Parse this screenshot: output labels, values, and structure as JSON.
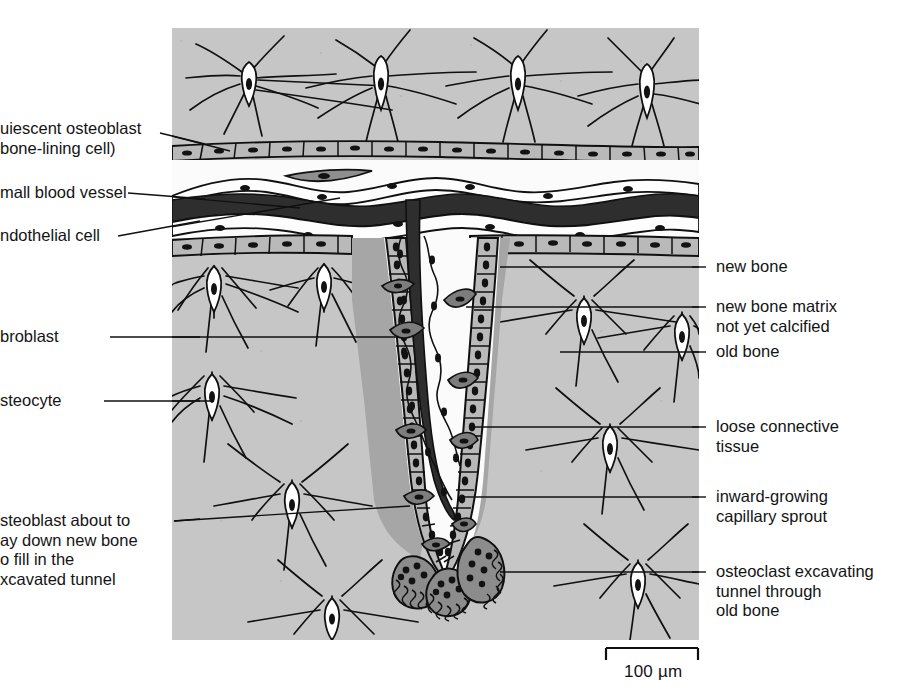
{
  "figure": {
    "title_present": false,
    "panel": {
      "x": 172,
      "y": 28,
      "width": 527,
      "height": 612
    },
    "colors": {
      "old_bone": "#c6c6c6",
      "new_bone_matrix_uncalcified": "#a6a6a6",
      "cell_fill": "#b9b9b9",
      "blood_vessel_lumen": "#2e2e2e",
      "osteoclast_fill": "#8c8c8c",
      "nucleus": "#121212",
      "lacuna": "#ffffff",
      "outline": "#101010",
      "background": "#ffffff"
    }
  },
  "labels_left": [
    {
      "name": "quiescent-osteoblast",
      "lines": [
        "uiescent osteoblast",
        "bone-lining cell)"
      ],
      "full_text": "quiescent osteoblast (bone-lining cell)",
      "clipped_at_left_edge": true,
      "x": 0,
      "y": 120
    },
    {
      "name": "small-blood-vessel",
      "lines": [
        "mall blood vessel"
      ],
      "full_text": "small blood vessel",
      "clipped_at_left_edge": true,
      "x": 0,
      "y": 185
    },
    {
      "name": "endothelial-cell",
      "lines": [
        "ndothelial cell"
      ],
      "full_text": "endothelial cell",
      "clipped_at_left_edge": true,
      "x": 0,
      "y": 228
    },
    {
      "name": "fibroblast",
      "lines": [
        "broblast"
      ],
      "full_text": "fibroblast",
      "clipped_at_left_edge": true,
      "x": 0,
      "y": 328
    },
    {
      "name": "osteocyte",
      "lines": [
        "steocyte"
      ],
      "full_text": "osteocyte",
      "clipped_at_left_edge": true,
      "x": 0,
      "y": 392
    },
    {
      "name": "osteoblast-about-to-lay-down-new-bone",
      "lines": [
        "steoblast about to",
        "ay down new bone",
        "o fill in the",
        "xcavated tunnel"
      ],
      "full_text": "osteoblast about to lay down new bone to fill in the excavated tunnel",
      "clipped_at_left_edge": true,
      "x": 0,
      "y": 512
    }
  ],
  "labels_right": [
    {
      "name": "new-bone",
      "lines": [
        "new bone"
      ],
      "full_text": "new bone",
      "x": 716,
      "y": 258
    },
    {
      "name": "new-bone-matrix-not-yet-calcified",
      "lines": [
        "new bone matrix",
        "not yet calcified"
      ],
      "full_text": "new bone matrix not yet calcified",
      "x": 716,
      "y": 298
    },
    {
      "name": "old-bone",
      "lines": [
        "old bone"
      ],
      "full_text": "old bone",
      "x": 716,
      "y": 343
    },
    {
      "name": "loose-connective-tissue",
      "lines": [
        "loose connective",
        "tissue"
      ],
      "full_text": "loose connective tissue",
      "x": 716,
      "y": 418
    },
    {
      "name": "inward-growing-capillary-sprout",
      "lines": [
        "inward-growing",
        "capillary sprout"
      ],
      "full_text": "inward-growing capillary sprout",
      "x": 716,
      "y": 488
    },
    {
      "name": "osteoclast-excavating-tunnel",
      "lines": [
        "osteoclast excavating",
        "tunnel through",
        "old bone"
      ],
      "full_text": "osteoclast excavating tunnel through old bone",
      "x": 716,
      "y": 563
    }
  ],
  "scale_bar": {
    "name": "scale-bar",
    "caption": "100 µm",
    "value": 100,
    "unit": "µm",
    "x_start": 606,
    "x_end": 698,
    "y": 655,
    "caption_x": 625,
    "caption_y": 666
  }
}
